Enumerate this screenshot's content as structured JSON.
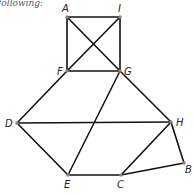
{
  "caption": "following:",
  "graph": {
    "nodes": [
      {
        "id": "A",
        "x": 67,
        "y": 17,
        "lx": 62,
        "ly": 12
      },
      {
        "id": "I",
        "x": 120,
        "y": 17,
        "lx": 118,
        "ly": 12
      },
      {
        "id": "F",
        "x": 67,
        "y": 71,
        "lx": 57,
        "ly": 75
      },
      {
        "id": "G",
        "x": 120,
        "y": 71,
        "lx": 124,
        "ly": 75
      },
      {
        "id": "D",
        "x": 17,
        "y": 123,
        "lx": 5,
        "ly": 127
      },
      {
        "id": "H",
        "x": 171,
        "y": 122,
        "lx": 176,
        "ly": 126
      },
      {
        "id": "B",
        "x": 184,
        "y": 163,
        "lx": 185,
        "ly": 173
      },
      {
        "id": "E",
        "x": 68,
        "y": 175,
        "lx": 64,
        "ly": 188
      },
      {
        "id": "C",
        "x": 121,
        "y": 175,
        "lx": 117,
        "ly": 188
      }
    ],
    "edges": [
      [
        "A",
        "I"
      ],
      [
        "A",
        "F"
      ],
      [
        "A",
        "G"
      ],
      [
        "I",
        "F"
      ],
      [
        "I",
        "G"
      ],
      [
        "F",
        "G"
      ],
      [
        "F",
        "D"
      ],
      [
        "G",
        "E"
      ],
      [
        "G",
        "H"
      ],
      [
        "D",
        "H"
      ],
      [
        "D",
        "E"
      ],
      [
        "E",
        "C"
      ],
      [
        "C",
        "H"
      ],
      [
        "C",
        "B"
      ],
      [
        "H",
        "B"
      ]
    ]
  }
}
